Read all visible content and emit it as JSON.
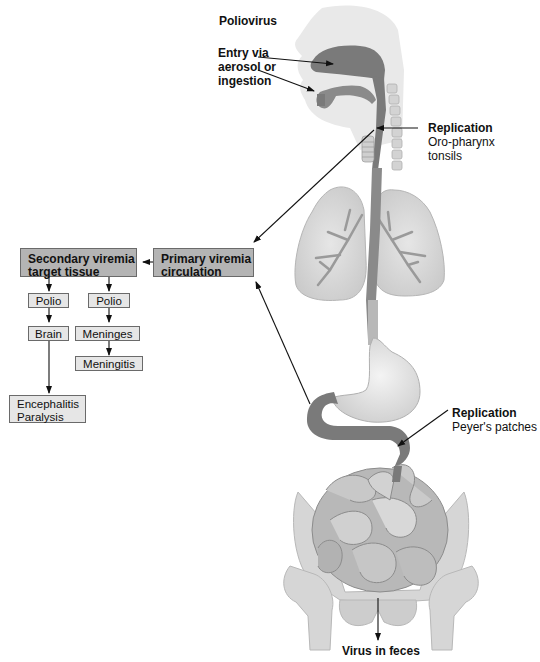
{
  "title": "Poliovirus",
  "labels": {
    "entry": {
      "line1": "Entry via",
      "line2": "aerosol or",
      "line3": "ingestion"
    },
    "replication_oro": {
      "heading": "Replication",
      "line1": "Oro-pharynx",
      "line2": "tonsils"
    },
    "replication_peyer": {
      "heading": "Replication",
      "line1": "Peyer's patches"
    },
    "exit": "Virus in feces"
  },
  "boxes": {
    "primary_viremia": {
      "line1": "Primary viremia",
      "line2": "circulation"
    },
    "secondary_viremia": {
      "line1": "Secondary viremia",
      "line2": "target tissue"
    },
    "left_branch": [
      "Polio",
      "Brain"
    ],
    "right_branch": [
      "Polio",
      "Meninges",
      "Meningitis"
    ],
    "outcome": {
      "line1": "Encephalitis",
      "line2": "Paralysis"
    }
  },
  "colors": {
    "infected_tract": "#7a7a7a",
    "tissue_light": "#dcdcdc",
    "tissue_mid": "#bdbdbd",
    "dark_box": "#b4b4b4",
    "light_box": "#e6e6e6"
  }
}
